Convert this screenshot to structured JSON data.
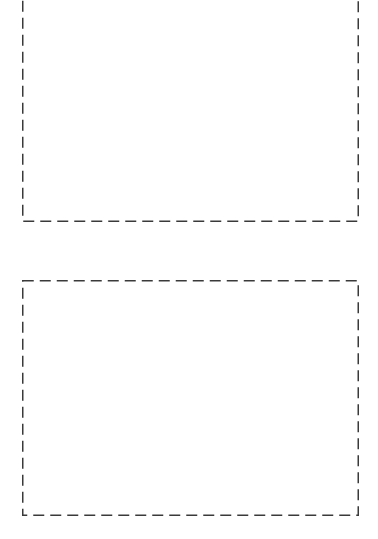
{
  "colors": {
    "background": "#ffffff",
    "dash_border": "#3a3a3a"
  },
  "placeholders": [
    {
      "id": "box-1",
      "label": ""
    },
    {
      "id": "box-2",
      "label": ""
    }
  ]
}
